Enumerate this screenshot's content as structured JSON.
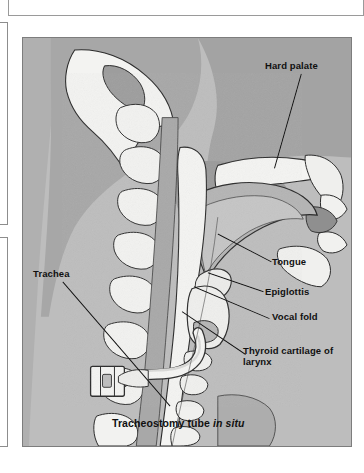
{
  "figure": {
    "caption": "Tracheostomy tube in situ",
    "caption_plain": "Tracheostomy tube",
    "caption_italic": "in situ",
    "labels": {
      "hard_palate": "Hard palate",
      "tongue": "Tongue",
      "epiglottis": "Epiglottis",
      "vocal_fold": "Vocal fold",
      "thyroid_cartilage": "Thyroid cartilage of larynx",
      "trachea": "Trachea"
    },
    "colors": {
      "tissue_light": "#c2c2c2",
      "tissue_mid": "#ababab",
      "tissue_dark": "#949494",
      "bone_white": "#f2f2f0",
      "outline": "#2a2a2a",
      "panel_border": "#7d7d7d",
      "label_text": "#101010"
    },
    "view": "sagittal section of head and neck"
  }
}
